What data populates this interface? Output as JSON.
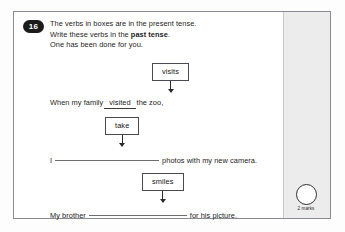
{
  "question": {
    "number": "16",
    "marks": {
      "circle_icon": "mark-circle-icon",
      "label": "2 marks"
    },
    "instructions": [
      "The verbs in boxes are in the present tense.",
      {
        "pre": "Write these verbs in the ",
        "bold": "past tense",
        "post": "."
      },
      "One has been done for you."
    ],
    "items": [
      {
        "verb_box": "visits",
        "arrow_icon": "down-arrow-icon",
        "sentence_before": "When my family",
        "answer": "visited",
        "answer_filled": true,
        "sentence_after": "the zoo,"
      },
      {
        "verb_box": "take",
        "arrow_icon": "down-arrow-icon",
        "sentence_before": "I",
        "answer": "",
        "answer_filled": false,
        "sentence_after": "photos with my new camera."
      },
      {
        "verb_box": "smiles",
        "arrow_icon": "down-arrow-icon",
        "sentence_before": "My brother",
        "answer": "",
        "answer_filled": false,
        "sentence_after": "for his picture."
      }
    ]
  },
  "colors": {
    "frame_border": "#8a8a92",
    "badge_background": "#1b1b1b",
    "margin_band": "#ececec",
    "text": "#1c1c1c"
  }
}
